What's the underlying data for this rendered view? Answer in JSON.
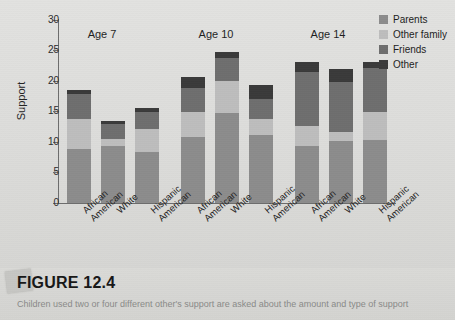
{
  "figure": {
    "number_label": "FIGURE 12.4",
    "caption": "Children used two or four different other's support are asked about the amount and type of support"
  },
  "legend": {
    "items": [
      {
        "label": "Parents",
        "color": "#8c8c8c",
        "key": "parents"
      },
      {
        "label": "Other family",
        "color": "#bdbdbd",
        "key": "other_family"
      },
      {
        "label": "Friends",
        "color": "#6e6e6e",
        "key": "friends"
      },
      {
        "label": "Other",
        "color": "#3a3a3a",
        "key": "other"
      }
    ]
  },
  "group_headers": [
    {
      "label": "Age 7"
    },
    {
      "label": "Age 10"
    },
    {
      "label": "Age 14"
    }
  ],
  "axes": {
    "y_title": "Support",
    "x_title": "Group",
    "y_ticks": [
      "0",
      "5",
      "10",
      "15",
      "20",
      "25",
      "30"
    ]
  },
  "chart_data": {
    "type": "bar",
    "title": "",
    "xlabel": "Group",
    "ylabel": "Support",
    "ylim": [
      0,
      30
    ],
    "ytick_step": 5,
    "grid": false,
    "stacked": true,
    "legend_position": "right",
    "groups": [
      "Age 7",
      "Age 10",
      "Age 14"
    ],
    "categories": [
      "African American",
      "White",
      "Hispanic American",
      "African American",
      "White",
      "Hispanic American",
      "African American",
      "White",
      "Hispanic American"
    ],
    "series": [
      {
        "name": "Parents",
        "color": "#8c8c8c",
        "values": [
          8.9,
          9.3,
          8.4,
          10.9,
          14.8,
          11.2,
          9.4,
          10.1,
          10.4
        ]
      },
      {
        "name": "Other family",
        "color": "#bdbdbd",
        "values": [
          4.9,
          1.2,
          3.8,
          4.0,
          5.2,
          2.6,
          3.2,
          1.6,
          4.5
        ]
      },
      {
        "name": "Friends",
        "color": "#6e6e6e",
        "values": [
          4.1,
          2.4,
          2.7,
          4.0,
          3.7,
          3.3,
          8.9,
          8.2,
          7.2
        ]
      },
      {
        "name": "Other",
        "color": "#3a3a3a",
        "values": [
          0.6,
          0.6,
          0.6,
          1.8,
          1.0,
          2.2,
          1.6,
          2.1,
          1.1
        ]
      }
    ],
    "totals": [
      18.5,
      13.5,
      15.5,
      20.7,
      24.7,
      19.3,
      23.1,
      22.0,
      23.2
    ]
  }
}
